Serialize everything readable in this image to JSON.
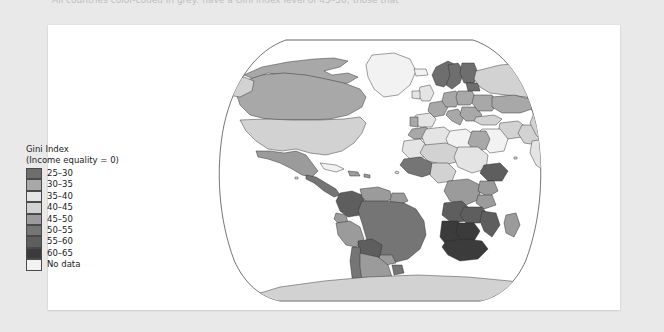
{
  "page": {
    "background_color": "#e9e9e9",
    "clipped_top_text": "All countries color-coded in grey: have a Gini index level of 45–50; those that",
    "panel_background": "#ffffff"
  },
  "legend": {
    "title": "Gini Index",
    "subtitle": "(Income equality = 0)",
    "entries": [
      {
        "label": "25–30",
        "color": "#6e6e6e"
      },
      {
        "label": "30–35",
        "color": "#a8a8a8"
      },
      {
        "label": "35–40",
        "color": "#e4e4e4"
      },
      {
        "label": "40–45",
        "color": "#d2d2d2"
      },
      {
        "label": "45–50",
        "color": "#9b9b9b"
      },
      {
        "label": "50–55",
        "color": "#757575"
      },
      {
        "label": "55–60",
        "color": "#5e5e5e"
      },
      {
        "label": "60–65",
        "color": "#3b3b3b"
      },
      {
        "label": "No data",
        "color": "#f2f2f2"
      }
    ]
  },
  "map": {
    "type": "choropleth",
    "projection": "robinson",
    "ocean_color": "#ffffff",
    "border_color": "#2a2a2a",
    "frame_color": "#3a3a3a",
    "variable": "Gini Index",
    "regions": [
      {
        "name": "Canada",
        "band": "30–35",
        "color": "#a8a8a8"
      },
      {
        "name": "Greenland",
        "band": "No data",
        "color": "#f2f2f2"
      },
      {
        "name": "Alaska",
        "band": "40–45",
        "color": "#d2d2d2"
      },
      {
        "name": "United States",
        "band": "40–45",
        "color": "#d2d2d2"
      },
      {
        "name": "Mexico",
        "band": "45–50",
        "color": "#9b9b9b"
      },
      {
        "name": "Central America",
        "band": "50–55",
        "color": "#757575"
      },
      {
        "name": "Cuba",
        "band": "No data",
        "color": "#f2f2f2"
      },
      {
        "name": "Colombia",
        "band": "55–60",
        "color": "#5e5e5e"
      },
      {
        "name": "Venezuela",
        "band": "45–50",
        "color": "#9b9b9b"
      },
      {
        "name": "Brazil",
        "band": "50–55",
        "color": "#757575"
      },
      {
        "name": "Peru",
        "band": "45–50",
        "color": "#9b9b9b"
      },
      {
        "name": "Bolivia",
        "band": "55–60",
        "color": "#5e5e5e"
      },
      {
        "name": "Chile",
        "band": "50–55",
        "color": "#757575"
      },
      {
        "name": "Argentina",
        "band": "45–50",
        "color": "#9b9b9b"
      },
      {
        "name": "Norway",
        "band": "25–30",
        "color": "#6e6e6e"
      },
      {
        "name": "Sweden",
        "band": "25–30",
        "color": "#6e6e6e"
      },
      {
        "name": "Finland",
        "band": "25–30",
        "color": "#6e6e6e"
      },
      {
        "name": "United Kingdom",
        "band": "35–40",
        "color": "#e4e4e4"
      },
      {
        "name": "France",
        "band": "30–35",
        "color": "#a8a8a8"
      },
      {
        "name": "Spain",
        "band": "35–40",
        "color": "#e4e4e4"
      },
      {
        "name": "Germany",
        "band": "30–35",
        "color": "#a8a8a8"
      },
      {
        "name": "Poland",
        "band": "30–35",
        "color": "#a8a8a8"
      },
      {
        "name": "Russia",
        "band": "40–45",
        "color": "#d2d2d2"
      },
      {
        "name": "Turkey",
        "band": "40–45",
        "color": "#d2d2d2"
      },
      {
        "name": "Kazakhstan",
        "band": "30–35",
        "color": "#a8a8a8"
      },
      {
        "name": "China",
        "band": "40–45",
        "color": "#d2d2d2"
      },
      {
        "name": "Mongolia",
        "band": "35–40",
        "color": "#e4e4e4"
      },
      {
        "name": "India",
        "band": "35–40",
        "color": "#e4e4e4"
      },
      {
        "name": "Iran",
        "band": "40–45",
        "color": "#d2d2d2"
      },
      {
        "name": "Saudi Arabia",
        "band": "No data",
        "color": "#f2f2f2"
      },
      {
        "name": "Japan",
        "band": "30–35",
        "color": "#a8a8a8"
      },
      {
        "name": "Indonesia",
        "band": "35–40",
        "color": "#e4e4e4"
      },
      {
        "name": "Papua New Guinea",
        "band": "50–55",
        "color": "#757575"
      },
      {
        "name": "Australia",
        "band": "35–40",
        "color": "#e4e4e4"
      },
      {
        "name": "New Zealand",
        "band": "35–40",
        "color": "#e4e4e4"
      },
      {
        "name": "Egypt",
        "band": "30–35",
        "color": "#a8a8a8"
      },
      {
        "name": "Algeria",
        "band": "35–40",
        "color": "#e4e4e4"
      },
      {
        "name": "Libya",
        "band": "No data",
        "color": "#f2f2f2"
      },
      {
        "name": "Nigeria",
        "band": "40–45",
        "color": "#d2d2d2"
      },
      {
        "name": "Ethiopia",
        "band": "55–60",
        "color": "#5e5e5e"
      },
      {
        "name": "Kenya",
        "band": "45–50",
        "color": "#9b9b9b"
      },
      {
        "name": "D.R. Congo",
        "band": "45–50",
        "color": "#9b9b9b"
      },
      {
        "name": "Angola",
        "band": "55–60",
        "color": "#5e5e5e"
      },
      {
        "name": "Zambia",
        "band": "55–60",
        "color": "#5e5e5e"
      },
      {
        "name": "South Africa",
        "band": "60–65",
        "color": "#3b3b3b"
      },
      {
        "name": "Namibia",
        "band": "60–65",
        "color": "#3b3b3b"
      },
      {
        "name": "Botswana",
        "band": "60–65",
        "color": "#3b3b3b"
      },
      {
        "name": "Madagascar",
        "band": "45–50",
        "color": "#9b9b9b"
      },
      {
        "name": "Antarctica",
        "band": "No data",
        "color": "#d2d2d2"
      }
    ]
  }
}
